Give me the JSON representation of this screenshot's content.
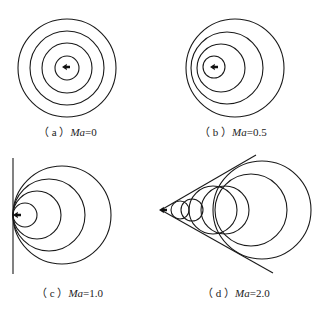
{
  "figure": {
    "colors": {
      "line": "#1a1a1a",
      "background": "#ffffff",
      "text": "#222222"
    }
  },
  "panels": [
    {
      "id": "a",
      "prefix": "（ a ）",
      "var": "Ma",
      "value": "=0",
      "label_full": "（a）Ma=0",
      "source": {
        "x": 66,
        "y": 67
      },
      "circles": [
        {
          "cx": 67,
          "cy": 68,
          "r": 12
        },
        {
          "cx": 67,
          "cy": 68,
          "r": 25
        },
        {
          "cx": 67,
          "cy": 68,
          "r": 37
        },
        {
          "cx": 67,
          "cy": 68,
          "r": 49
        }
      ]
    },
    {
      "id": "b",
      "prefix": "（ b ）",
      "var": "Ma",
      "value": "=0.5",
      "label_full": "（b）Ma=0.5",
      "source": {
        "x": 214,
        "y": 67
      },
      "circles": [
        {
          "cx": 214,
          "cy": 67,
          "r": 11
        },
        {
          "cx": 221,
          "cy": 68,
          "r": 24
        },
        {
          "cx": 227,
          "cy": 68,
          "r": 36
        },
        {
          "cx": 235,
          "cy": 68,
          "r": 49
        }
      ]
    },
    {
      "id": "c",
      "prefix": "（ c ）",
      "var": "Ma",
      "value": "=1.0",
      "label_full": "（c）Ma=1.0",
      "source": {
        "x": 17,
        "y": 215
      },
      "wavefront_line": {
        "x1": 13,
        "y1": 158,
        "x2": 13,
        "y2": 274
      },
      "circles": [
        {
          "cx": 25,
          "cy": 215,
          "r": 12
        },
        {
          "cx": 37,
          "cy": 215,
          "r": 24
        },
        {
          "cx": 49,
          "cy": 215,
          "r": 36
        },
        {
          "cx": 62,
          "cy": 215,
          "r": 49
        }
      ]
    },
    {
      "id": "d",
      "prefix": "（ d ）",
      "var": "Ma",
      "value": "=2.0",
      "label_full": "（d）Ma=2.0",
      "source": {
        "x": 163,
        "y": 210
      },
      "mach_cone": {
        "apex": {
          "x": 161,
          "y": 210
        },
        "upper_end": {
          "x": 256,
          "y": 155
        },
        "lower_end": {
          "x": 273,
          "y": 273
        }
      },
      "circles": [
        {
          "cx": 180,
          "cy": 210,
          "r": 9
        },
        {
          "cx": 192,
          "cy": 210,
          "r": 11
        },
        {
          "cx": 213,
          "cy": 210,
          "r": 24
        },
        {
          "cx": 225,
          "cy": 210,
          "r": 24
        },
        {
          "cx": 251,
          "cy": 210,
          "r": 36
        },
        {
          "cx": 262,
          "cy": 210,
          "r": 49
        }
      ]
    }
  ]
}
